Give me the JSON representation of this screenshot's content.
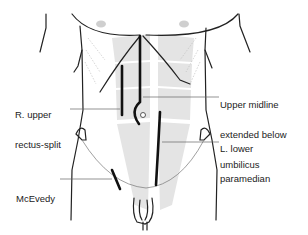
{
  "diagram": {
    "type": "anatomical-illustration",
    "colors": {
      "outline": "#222222",
      "incision": "#111111",
      "leader": "#666666",
      "rectus_shading": "#e2e2e2",
      "text": "#222222"
    },
    "labels": {
      "r_upper": {
        "line1": "R. upper",
        "line2": "rectus-split"
      },
      "upper_midline": {
        "line1": "Upper midline",
        "line2": "extended below",
        "line3": "umbilicus"
      },
      "l_lower": {
        "line1": "L. lower",
        "line2": "paramedian"
      },
      "mcevedy": {
        "line1": "McEvedy"
      }
    },
    "incisions": [
      {
        "id": "r-upper-rectus-split",
        "name": "R. upper rectus-split"
      },
      {
        "id": "upper-midline",
        "name": "Upper midline extended below umbilicus"
      },
      {
        "id": "l-lower-paramedian",
        "name": "L. lower paramedian"
      },
      {
        "id": "mcevedy",
        "name": "McEvedy"
      }
    ]
  }
}
